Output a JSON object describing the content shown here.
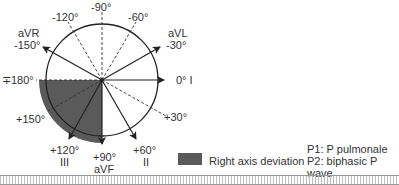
{
  "diagram": {
    "axes": [
      {
        "angle": "-90°",
        "lead": ""
      },
      {
        "angle": "-120°",
        "lead": ""
      },
      {
        "angle": "-60°",
        "lead": ""
      },
      {
        "angle": "-150°",
        "lead": "aVR"
      },
      {
        "angle": "-30°",
        "lead": "aVL"
      },
      {
        "angle": "∓180°",
        "lead": ""
      },
      {
        "angle": "0°",
        "lead": "I"
      },
      {
        "angle": "+150°",
        "lead": ""
      },
      {
        "angle": "+30°",
        "lead": ""
      },
      {
        "angle": "+120°",
        "lead": "III"
      },
      {
        "angle": "+90°",
        "lead": "aVF"
      },
      {
        "angle": "+60°",
        "lead": "II"
      }
    ],
    "shaded_region": {
      "from": "+90°",
      "to": "180°",
      "color": "#5a5a5a"
    }
  },
  "legend": {
    "label": "Right axis deviation",
    "color": "#5a5a5a"
  },
  "notes": {
    "p1": "P1: P pulmonale",
    "p2": "P2: biphasic P wave"
  }
}
